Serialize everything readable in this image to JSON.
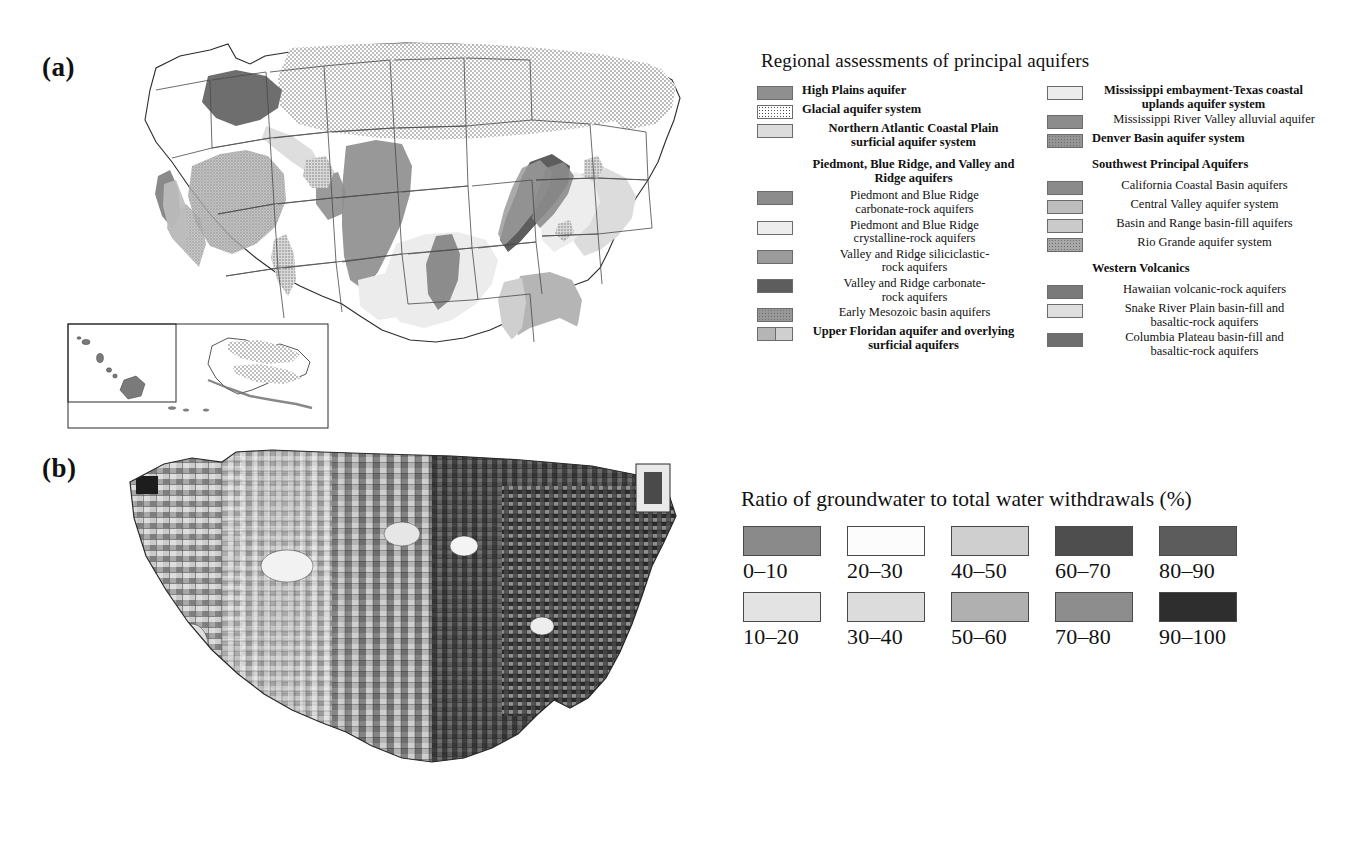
{
  "figure": {
    "panel_a_label": "(a)",
    "panel_b_label": "(b)"
  },
  "legend_a": {
    "title": "Regional assessments of principal aquifers",
    "left_column": [
      {
        "label": "High Plains aquifer",
        "bold": true,
        "align": "left",
        "swatch": "solid",
        "color": "#8f8f8f",
        "indent": false
      },
      {
        "label": "Glacial aquifer system",
        "bold": true,
        "align": "left",
        "swatch": "stipple-light",
        "color": "#ffffff",
        "indent": false
      },
      {
        "label": "Northern Atlantic Coastal Plain\nsurficial aquifer system",
        "bold": true,
        "align": "center",
        "swatch": "solid",
        "color": "#dcdcdc",
        "indent": false
      },
      {
        "label": "Piedmont, Blue Ridge, and Valley and\nRidge aquifers",
        "bold": true,
        "align": "center",
        "swatch": "none",
        "color": null,
        "indent": false
      },
      {
        "label": "Piedmont and Blue Ridge\ncarbonate-rock aquifers",
        "bold": false,
        "align": "center",
        "swatch": "solid",
        "color": "#8c8c8c",
        "indent": true
      },
      {
        "label": "Piedmont and Blue Ridge\ncrystalline-rock aquifers",
        "bold": false,
        "align": "center",
        "swatch": "solid",
        "color": "#ededed",
        "indent": true
      },
      {
        "label": "Valley and Ridge siliciclastic-\nrock aquifers",
        "bold": false,
        "align": "center",
        "swatch": "solid",
        "color": "#9b9b9b",
        "indent": true
      },
      {
        "label": "Valley and Ridge carbonate-\nrock aquifers",
        "bold": false,
        "align": "center",
        "swatch": "solid",
        "color": "#5d5d5d",
        "indent": true
      },
      {
        "label": "Early Mesozoic basin  aquifers",
        "bold": false,
        "align": "center",
        "swatch": "stipple-med",
        "color": "#989898",
        "indent": true
      },
      {
        "label": "Upper Floridan aquifer and overlying\nsurficial aquifers",
        "bold": true,
        "align": "center",
        "swatch": "split",
        "color": "#b5b5b5",
        "color2": "#cfcfcf",
        "indent": false
      }
    ],
    "right_column": [
      {
        "label": "Mississippi embayment-Texas coastal\nuplands aquifer system",
        "bold": true,
        "align": "center",
        "swatch": "solid",
        "color": "#ececec",
        "indent": false
      },
      {
        "label": "Mississippi River Valley alluvial aquifer",
        "bold": false,
        "align": "right",
        "swatch": "solid",
        "color": "#8c8c8c",
        "indent": false
      },
      {
        "label": "Denver Basin aquifer system",
        "bold": true,
        "align": "left",
        "swatch": "stipple-med",
        "color": "#959595",
        "indent": false
      },
      {
        "label": "Southwest Principal Aquifers",
        "bold": true,
        "align": "left",
        "swatch": "none",
        "color": null,
        "indent": false
      },
      {
        "label": "California Coastal Basin aquifers",
        "bold": false,
        "align": "center",
        "swatch": "solid",
        "color": "#8a8a8a",
        "indent": true
      },
      {
        "label": "Central Valley aquifer system",
        "bold": false,
        "align": "center",
        "swatch": "solid",
        "color": "#bdbdbd",
        "indent": true
      },
      {
        "label": "Basin and Range basin-fill aquifers",
        "bold": false,
        "align": "center",
        "swatch": "solid",
        "color": "#cacaca",
        "indent": true
      },
      {
        "label": "Rio Grande aquifer system",
        "bold": false,
        "align": "center",
        "swatch": "stipple-med",
        "color": "#a8a8a8",
        "indent": true
      },
      {
        "label": "Western Volcanics",
        "bold": true,
        "align": "left",
        "swatch": "none",
        "color": null,
        "indent": false
      },
      {
        "label": "Hawaiian volcanic-rock aquifers",
        "bold": false,
        "align": "center",
        "swatch": "solid",
        "color": "#7a7a7a",
        "indent": true
      },
      {
        "label": "Snake River Plain basin-fill and\nbasaltic-rock aquifers",
        "bold": false,
        "align": "center",
        "swatch": "solid",
        "color": "#dedede",
        "indent": true
      },
      {
        "label": "Columbia Plateau basin-fill and\nbasaltic-rock aquifers",
        "bold": false,
        "align": "center",
        "swatch": "solid",
        "color": "#6e6e6e",
        "indent": true
      }
    ]
  },
  "legend_b": {
    "title": "Ratio of groundwater to total water withdrawals (%)"
  },
  "chart_data": {
    "type": "map",
    "title": "Ratio of groundwater to total water withdrawals (%)",
    "classes": [
      {
        "label": "0–10",
        "color": "#8a8a8a",
        "row": 1,
        "col": 1
      },
      {
        "label": "10–20",
        "color": "#e3e3e3",
        "row": 2,
        "col": 1
      },
      {
        "label": "20–30",
        "color": "#fcfcfc",
        "row": 1,
        "col": 2
      },
      {
        "label": "30–40",
        "color": "#dcdcdc",
        "row": 2,
        "col": 2
      },
      {
        "label": "40–50",
        "color": "#cfcfcf",
        "row": 1,
        "col": 3
      },
      {
        "label": "50–60",
        "color": "#b0b0b0",
        "row": 2,
        "col": 3
      },
      {
        "label": "60–70",
        "color": "#4e4e4e",
        "row": 1,
        "col": 4
      },
      {
        "label": "70–80",
        "color": "#8d8d8d",
        "row": 2,
        "col": 4
      },
      {
        "label": "80–90",
        "color": "#5c5c5c",
        "row": 1,
        "col": 5
      },
      {
        "label": "90–100",
        "color": "#2e2e2e",
        "row": 2,
        "col": 5
      }
    ],
    "geography": "United States, county level",
    "legend_position": "right"
  },
  "caption": ""
}
